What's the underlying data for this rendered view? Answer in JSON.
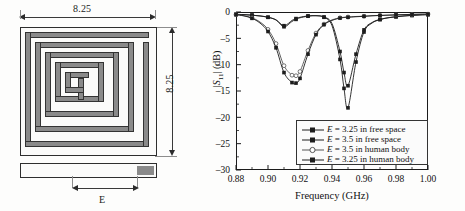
{
  "figure": {
    "left_panel": {
      "name": "spiral-antenna-geometry",
      "width_label": "8.25",
      "height_label": "8.25",
      "feed_label": "E",
      "metal_color": "#8a8a8a",
      "outline_color": "#2e2e2e"
    }
  },
  "chart_data": {
    "type": "line",
    "title": "",
    "xlabel": "Frequency (GHz)",
    "ylabel": "|S11| (dB)",
    "ylabel_parts": {
      "pre": "|",
      "sym": "S",
      "sub": "11",
      "post": "| (dB)"
    },
    "xlim": [
      0.88,
      1.0
    ],
    "ylim": [
      -30,
      0
    ],
    "xticks": [
      "0.88",
      "0.90",
      "0.92",
      "0.94",
      "0.96",
      "0.98",
      "1.00"
    ],
    "xtick_values": [
      0.88,
      0.9,
      0.92,
      0.94,
      0.96,
      0.98,
      1.0
    ],
    "yticks": [
      "0",
      "–5",
      "–10",
      "–15",
      "–20",
      "–25",
      "–30"
    ],
    "ytick_values": [
      0,
      -5,
      -10,
      -15,
      -20,
      -25,
      -30
    ],
    "grid": false,
    "legend_position": "lower-right-inside",
    "x": [
      0.88,
      0.885,
      0.89,
      0.895,
      0.9,
      0.905,
      0.91,
      0.915,
      0.9175,
      0.92,
      0.925,
      0.93,
      0.935,
      0.94,
      0.945,
      0.9475,
      0.95,
      0.955,
      0.96,
      0.965,
      0.97,
      0.975,
      0.98,
      0.985,
      0.99,
      0.995,
      1.0
    ],
    "series": [
      {
        "name": "E = 3.25 in free space",
        "label_pre": "E",
        "label_post": " = 3.25 in free space",
        "marker": "square-filled",
        "color": "#1d1d1d",
        "values": [
          -0.45,
          -0.5,
          -0.6,
          -0.75,
          -1.0,
          -1.5,
          -2.6,
          -1.6,
          -1.25,
          -1.0,
          -0.75,
          -0.7,
          -0.95,
          -2.2,
          -7.5,
          -11.5,
          -14.0,
          -8.0,
          -3.4,
          -2.0,
          -1.4,
          -1.1,
          -0.9,
          -0.75,
          -0.65,
          -0.55,
          -0.5
        ]
      },
      {
        "name": "E = 3.5 in free space",
        "label_pre": "E",
        "label_post": " = 3.5 in free space",
        "marker": "square-filled",
        "color": "#1d1d1d",
        "values": [
          -0.45,
          -0.5,
          -0.6,
          -0.75,
          -1.0,
          -1.5,
          -2.8,
          -1.8,
          -1.4,
          -1.1,
          -0.8,
          -0.7,
          -1.0,
          -2.6,
          -9.0,
          -14.5,
          -18.2,
          -9.5,
          -3.8,
          -2.1,
          -1.45,
          -1.1,
          -0.9,
          -0.75,
          -0.65,
          -0.55,
          -0.5
        ]
      },
      {
        "name": "E = 3.5 in human body",
        "label_pre": "E",
        "label_post": " = 3.5 in human body",
        "marker": "circle-open",
        "color": "#555555",
        "values": [
          -0.5,
          -0.7,
          -1.1,
          -1.9,
          -3.3,
          -6.0,
          -10.2,
          -12.0,
          -12.1,
          -11.3,
          -7.3,
          -4.0,
          -2.3,
          -1.5,
          -1.1,
          -1.0,
          -0.95,
          -0.85,
          -0.8,
          -0.7,
          -0.65,
          -0.6,
          -0.55,
          -0.5,
          -0.45,
          -0.42,
          -0.4
        ]
      },
      {
        "name": "E = 3.25 in human body",
        "label_pre": "E",
        "label_post": " = 3.25 in human body",
        "marker": "square-filled",
        "color": "#1d1d1d",
        "values": [
          -0.5,
          -0.75,
          -1.2,
          -2.1,
          -3.7,
          -6.8,
          -11.5,
          -13.4,
          -13.5,
          -12.6,
          -8.0,
          -4.3,
          -2.4,
          -1.6,
          -1.15,
          -1.05,
          -1.0,
          -0.9,
          -0.82,
          -0.72,
          -0.66,
          -0.6,
          -0.55,
          -0.5,
          -0.45,
          -0.42,
          -0.4
        ]
      }
    ]
  }
}
